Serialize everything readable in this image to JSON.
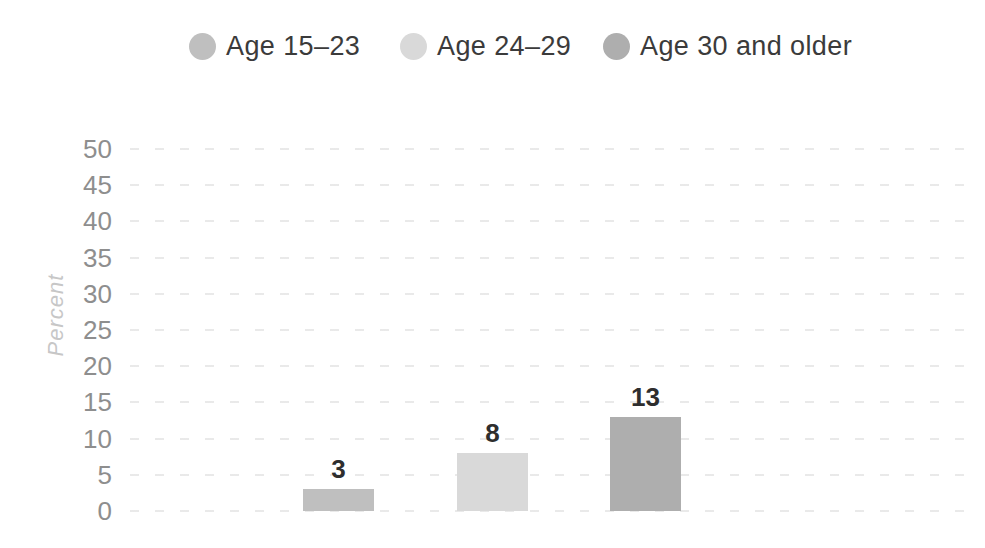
{
  "chart_data": {
    "type": "bar",
    "categories": [
      "Age 15–23",
      "Age 24–29",
      "Age 30 and older"
    ],
    "values": [
      3,
      8,
      13
    ],
    "series": [
      {
        "name": "Age 15–23",
        "value": 3,
        "color": "#bfbfbf",
        "data_label": "3"
      },
      {
        "name": "Age 24–29",
        "value": 8,
        "color": "#d9d9d9",
        "data_label": "8"
      },
      {
        "name": "Age 30 and older",
        "value": 13,
        "color": "#aeaeae",
        "data_label": "13"
      }
    ],
    "xlabel": "",
    "ylabel": "Percent",
    "ylim": [
      0,
      50
    ],
    "y_ticks": [
      0,
      5,
      10,
      15,
      20,
      25,
      30,
      35,
      40,
      45,
      50
    ],
    "grid": "horizontal dashed",
    "legend_position": "top",
    "x_category_labels_shown": false
  },
  "colors": {
    "background": "#ffffff",
    "legend_text": "#3b3b3b",
    "tick_text": "#8e8e8e",
    "axis_title_text": "#c7c7c7",
    "data_label_text": "#2e2e2e",
    "gridline": "#e4e4e4"
  }
}
